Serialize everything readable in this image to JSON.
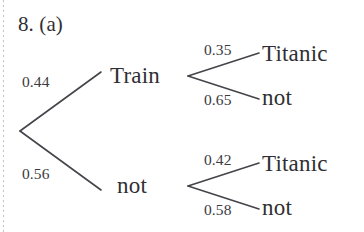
{
  "page": {
    "background_color": "#ffffff",
    "ink_color": "#2f2f33",
    "margin_rule_color": "#b9b9c2"
  },
  "exercise": {
    "number_label": "8. (a)"
  },
  "diagram": {
    "type": "probability-tree",
    "root": {
      "x": 20,
      "y": 131
    },
    "nodes": [
      {
        "id": "train",
        "label": "Train",
        "branch_probability": "0.44",
        "x": 188,
        "y": 76
      },
      {
        "id": "not-train",
        "label": "not",
        "branch_probability": "0.56",
        "x": 188,
        "y": 186
      }
    ],
    "leaves": [
      {
        "id": "train-titanic",
        "label": "Titanic",
        "branch_probability": "0.35",
        "parent": "train"
      },
      {
        "id": "train-not-titanic",
        "label": "not",
        "branch_probability": "0.65",
        "parent": "train"
      },
      {
        "id": "nottrain-titanic",
        "label": "Titanic",
        "branch_probability": "0.42",
        "parent": "not-train"
      },
      {
        "id": "nottrain-not",
        "label": "not",
        "branch_probability": "0.58",
        "parent": "not-train"
      }
    ],
    "edges": [
      {
        "id": "root-to-train",
        "probability": "0.44",
        "x1": 20,
        "y1": 131,
        "x2": 101,
        "y2": 72
      },
      {
        "id": "root-to-not",
        "probability": "0.56",
        "x1": 20,
        "y1": 131,
        "x2": 101,
        "y2": 190
      },
      {
        "id": "train-to-titanic",
        "probability": "0.35",
        "x1": 188,
        "y1": 76,
        "x2": 259,
        "y2": 53
      },
      {
        "id": "train-to-not",
        "probability": "0.65",
        "x1": 188,
        "y1": 76,
        "x2": 259,
        "y2": 99
      },
      {
        "id": "nottrain-to-titanic",
        "probability": "0.42",
        "x1": 188,
        "y1": 186,
        "x2": 259,
        "y2": 163
      },
      {
        "id": "nottrain-to-not",
        "probability": "0.58",
        "x1": 188,
        "y1": 186,
        "x2": 259,
        "y2": 209
      }
    ]
  }
}
